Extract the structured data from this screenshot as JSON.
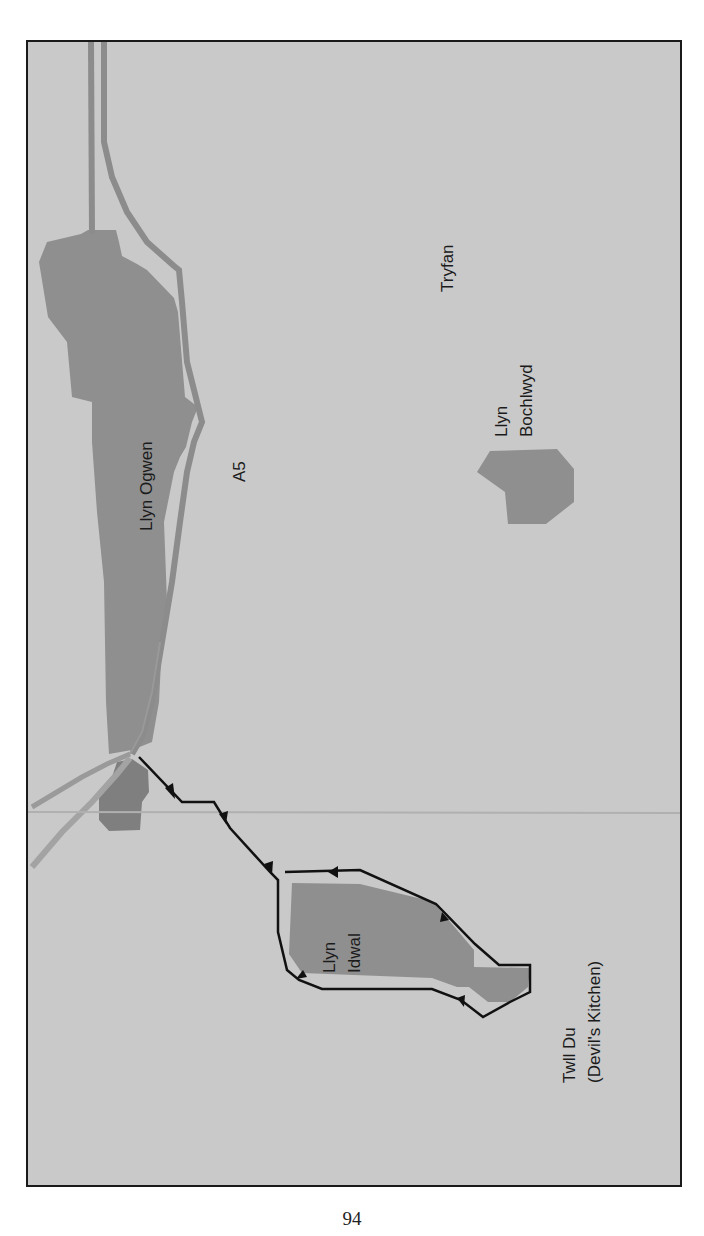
{
  "map": {
    "colors": {
      "background": "#c9c9c9",
      "lake": "#8f8f8f",
      "road": "#8c8c8c",
      "road_light": "#a3a3a3",
      "path": "#111111",
      "border": "#1a1a1a",
      "gutter": "#b3b3b3"
    },
    "labels": {
      "llyn_ogwen": "Llyn Ogwen",
      "a5": "A5",
      "tryfan": "Tryfan",
      "llyn_bochlwyd_line1": "Llyn",
      "llyn_bochlwyd_line2": "Bochlwyd",
      "llyn_idwal_line1": "Llyn",
      "llyn_idwal_line2": "Idwal",
      "twll_du_line1": "Twll Du",
      "twll_du_line2": "(Devil's Kitchen)"
    },
    "features": [
      {
        "type": "lake",
        "name": "Llyn Ogwen"
      },
      {
        "type": "lake",
        "name": "Llyn Bochlwyd"
      },
      {
        "type": "lake",
        "name": "Llyn Idwal"
      },
      {
        "type": "lake",
        "name": "small lake near A5 junction"
      },
      {
        "type": "road",
        "name": "A5"
      },
      {
        "type": "path",
        "name": "walking route with direction arrows"
      }
    ]
  },
  "page": {
    "number": "94"
  }
}
